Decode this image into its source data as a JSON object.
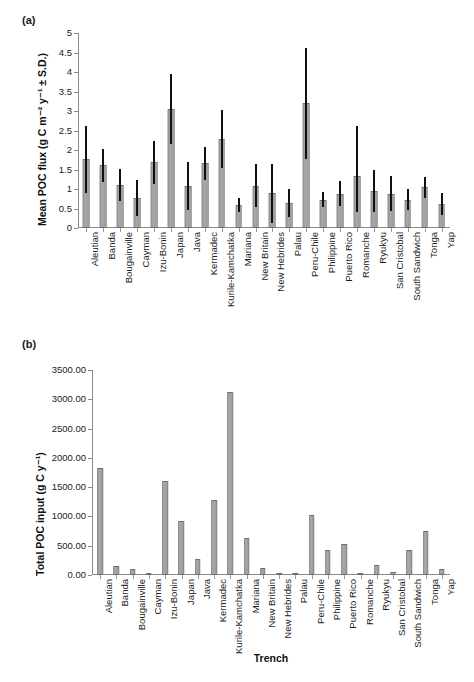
{
  "figure": {
    "panel_a_label": "(a)",
    "panel_b_label": "(b)"
  },
  "chart_data": [
    {
      "id": "panel-a",
      "type": "bar",
      "title": "",
      "panel": "(a)",
      "xlabel": "",
      "ylabel": "Mean POC flux (g C m-2 y-1 ± S.D.)",
      "ylabel_display": "Mean POC flux (g C m⁻² y⁻¹ ± S.D.)",
      "ylim": [
        0,
        5
      ],
      "yticks": [
        0,
        0.5,
        1,
        1.5,
        2,
        2.5,
        3,
        3.5,
        4,
        4.5,
        5
      ],
      "ytick_labels": [
        "0",
        "0.5",
        "1",
        "1.5",
        "2",
        "2.5",
        "3",
        "3.5",
        "4",
        "4.5",
        "5"
      ],
      "grid": false,
      "legend": "none",
      "categories": [
        "Aleutian",
        "Banda",
        "Bougainville",
        "Cayman",
        "Izu-Bonin",
        "Japan",
        "Java",
        "Kermadec",
        "Kurile-Kamchatka",
        "Mariana",
        "New Britain",
        "New Hebrides",
        "Palau",
        "Peru-Chile",
        "Philippine",
        "Puerto Rico",
        "Romanche",
        "Ryukyu",
        "San Cristobal",
        "South Sandwich",
        "Tonga",
        "Yap"
      ],
      "values": [
        1.77,
        1.61,
        1.11,
        0.78,
        1.7,
        3.06,
        1.08,
        1.66,
        2.28,
        0.58,
        1.09,
        0.89,
        0.64,
        3.21,
        0.73,
        0.88,
        1.34,
        0.95,
        0.88,
        0.72,
        1.04,
        0.61
      ],
      "err_upper": [
        2.61,
        2.03,
        1.52,
        1.23,
        2.22,
        3.96,
        1.69,
        2.08,
        3.03,
        0.76,
        1.65,
        1.64,
        1.01,
        4.62,
        0.92,
        1.21,
        2.61,
        1.49,
        1.33,
        0.99,
        1.32,
        0.89
      ],
      "err_lower": [
        0.91,
        1.18,
        0.7,
        0.31,
        1.14,
        2.15,
        0.47,
        1.22,
        1.53,
        0.41,
        0.54,
        0.14,
        0.27,
        1.78,
        0.55,
        0.56,
        0.41,
        0.41,
        0.43,
        0.46,
        0.76,
        0.33
      ],
      "bar_color": "#a2a2a2",
      "bar_edge_color": "#6e6e6e",
      "error_color": "#111111"
    },
    {
      "id": "panel-b",
      "type": "bar",
      "title": "",
      "panel": "(b)",
      "xlabel": "Trench",
      "ylabel": "Total POC input (g C y-1)",
      "ylabel_display": "Total POC input (g C y⁻¹)",
      "ylim": [
        0,
        3500
      ],
      "yticks": [
        0,
        500,
        1000,
        1500,
        2000,
        2500,
        3000,
        3500
      ],
      "ytick_labels": [
        "0.00",
        "500.00",
        "1000.00",
        "1500.00",
        "2000.00",
        "2500.00",
        "3000.00",
        "3500.00"
      ],
      "grid": false,
      "legend": "none",
      "categories": [
        "Aleutian",
        "Banda",
        "Bougainville",
        "Cayman",
        "Izu-Bonin",
        "Japan",
        "Java",
        "Kermadec",
        "Kurile-Kamchatka",
        "Mariana",
        "New Britain",
        "New Hebrides",
        "Palau",
        "Peru-Chile",
        "Philippine",
        "Puerto Rico",
        "Romanche",
        "Ryukyu",
        "San Cristobal",
        "South Sandwich",
        "Tonga",
        "Yap"
      ],
      "values": [
        1820,
        155,
        105,
        35,
        1600,
        930,
        265,
        1285,
        3130,
        640,
        120,
        20,
        15,
        1025,
        420,
        535,
        15,
        175,
        55,
        420,
        755,
        95
      ],
      "bar_color": "#a2a2a2",
      "bar_edge_color": "#6e6e6e"
    }
  ]
}
